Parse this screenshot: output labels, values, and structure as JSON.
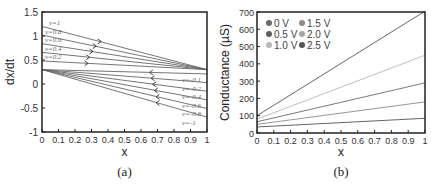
{
  "chart_data": [
    {
      "type": "line",
      "panel": "(a)",
      "xlabel": "x",
      "ylabel": "dx/dt",
      "xlim": [
        0,
        1
      ],
      "ylim": [
        -1,
        1.5
      ],
      "xticks": [
        "0",
        "0.1",
        "0.2",
        "0.3",
        "0.4",
        "0.5",
        "0.6",
        "0.7",
        "0.8",
        "0.9",
        "1"
      ],
      "yticks": [
        "1.5",
        "1",
        "0.5",
        "0",
        "-0.5",
        "-1"
      ],
      "grid": false,
      "series": [
        {
          "name": "v=1",
          "x": [
            0,
            1
          ],
          "y": [
            1.2,
            0.3
          ],
          "arrow_x": 0.35
        },
        {
          "name": "v=0.8",
          "x": [
            0,
            1
          ],
          "y": [
            1.02,
            0.3
          ],
          "arrow_x": 0.32
        },
        {
          "name": "v=0.6",
          "x": [
            0,
            1
          ],
          "y": [
            0.84,
            0.3
          ],
          "arrow_x": 0.3
        },
        {
          "name": "v=0.4",
          "x": [
            0,
            1
          ],
          "y": [
            0.66,
            0.3
          ],
          "arrow_x": 0.28
        },
        {
          "name": "v=0.2",
          "x": [
            0,
            1
          ],
          "y": [
            0.48,
            0.3
          ],
          "arrow_x": 0.27
        },
        {
          "name": "v=-0.1",
          "x": [
            0,
            1
          ],
          "y": [
            0.3,
            0.21
          ],
          "arrow_x": 0.66
        },
        {
          "name": "v=-0.2",
          "x": [
            0,
            1
          ],
          "y": [
            0.3,
            0.03
          ],
          "arrow_x": 0.67
        },
        {
          "name": "v=-0.4",
          "x": [
            0,
            1
          ],
          "y": [
            0.3,
            -0.15
          ],
          "arrow_x": 0.68
        },
        {
          "name": "v=-0.6",
          "x": [
            0,
            1
          ],
          "y": [
            0.3,
            -0.33
          ],
          "arrow_x": 0.69
        },
        {
          "name": "v=-0.8",
          "x": [
            0,
            1
          ],
          "y": [
            0.3,
            -0.51
          ],
          "arrow_x": 0.7
        },
        {
          "name": "v=-1",
          "x": [
            0,
            1
          ],
          "y": [
            0.3,
            -0.69
          ],
          "arrow_x": 0.7
        }
      ]
    },
    {
      "type": "line",
      "panel": "(b)",
      "xlabel": "x",
      "ylabel": "Conductance (µS)",
      "xlim": [
        0,
        1
      ],
      "ylim": [
        0,
        700
      ],
      "xticks": [
        "0",
        "0.1",
        "0.2",
        "0.3",
        "0.4",
        "0.5",
        "0.6",
        "0.7",
        "0.8",
        "0.9",
        "1"
      ],
      "yticks": [
        "700",
        "600",
        "500",
        "400",
        "300",
        "200",
        "100",
        "0"
      ],
      "grid": false,
      "legend_position": "upper left",
      "series": [
        {
          "name": "0 V",
          "color": "#5a5a5a",
          "x": [
            0,
            1
          ],
          "y": [
            35,
            85
          ]
        },
        {
          "name": "0.5 V",
          "color": "#6e6e6e",
          "x": [
            0,
            1
          ],
          "y": [
            50,
            180
          ]
        },
        {
          "name": "1.0 V",
          "color": "#b4b4b4",
          "x": [
            0,
            1
          ],
          "y": [
            65,
            290
          ]
        },
        {
          "name": "1.5 V",
          "color": "#8a8a8a",
          "x": [
            0,
            1
          ],
          "y": [
            80,
            450
          ]
        },
        {
          "name": "2.0 V",
          "color": "#a0a0a0",
          "x": [
            0,
            1
          ],
          "y": [
            95,
            710
          ]
        },
        {
          "name": "2.5 V",
          "color": "#555555",
          "x": [
            0,
            1
          ],
          "y": [
            100,
            710
          ]
        }
      ]
    }
  ],
  "panel_a": {
    "caption": "(a)",
    "xlabel": "x",
    "ylabel": "dx/dt",
    "xticks": [
      "0",
      "0.1",
      "0.2",
      "0.3",
      "0.4",
      "0.5",
      "0.6",
      "0.7",
      "0.8",
      "0.9",
      "1"
    ],
    "yticks": [
      "1.5",
      "1",
      "0.5",
      "0",
      "-0.5",
      "-1"
    ],
    "upper_labels": [
      "v=1",
      "v=0.8",
      "v=0.6",
      "v=0.4",
      "v=0.2"
    ],
    "lower_labels": [
      "v=-0.1",
      "v=-0.2",
      "v=-0.4",
      "v=-0.6",
      "v=-0.8",
      "v=-1"
    ]
  },
  "panel_b": {
    "caption": "(b)",
    "xlabel": "x",
    "ylabel": "Conductance (µS)",
    "xticks": [
      "0",
      "0.1",
      "0.2",
      "0.3",
      "0.4",
      "0.5",
      "0.6",
      "0.7",
      "0.8",
      "0.9",
      "1"
    ],
    "yticks": [
      "700",
      "600",
      "500",
      "400",
      "300",
      "200",
      "100",
      "0"
    ],
    "legend": [
      {
        "label": "0 V",
        "color": "#6a6a6a"
      },
      {
        "label": "0.5 V",
        "color": "#5e5e5e"
      },
      {
        "label": "1.0 V",
        "color": "#b8b8b8"
      },
      {
        "label": "1.5 V",
        "color": "#8c8c8c"
      },
      {
        "label": "2.0 V",
        "color": "#a6a6a6"
      },
      {
        "label": "2.5 V",
        "color": "#555555"
      }
    ]
  }
}
